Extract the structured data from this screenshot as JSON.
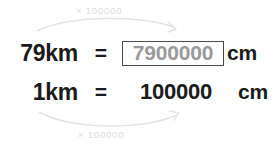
{
  "colors": {
    "background": "#ffffff",
    "text": "#1a1a1a",
    "answer_text": "#9a9a9a",
    "answer_border": "#4a4a4a",
    "arrow": "#e2e2e2",
    "arrow_label": "#dcdcdc"
  },
  "arrows": {
    "top": {
      "label": "× 100000",
      "direction": "left-to-right",
      "curve": "arc-above"
    },
    "bottom": {
      "label": "× 100000",
      "direction": "left-to-right",
      "curve": "arc-below"
    }
  },
  "equations": [
    {
      "lhs": "79km",
      "operator": "=",
      "value": "7900000",
      "unit": "cm",
      "boxed": true
    },
    {
      "lhs": "1km",
      "operator": "=",
      "value": "100000",
      "unit": "cm",
      "boxed": false
    }
  ]
}
